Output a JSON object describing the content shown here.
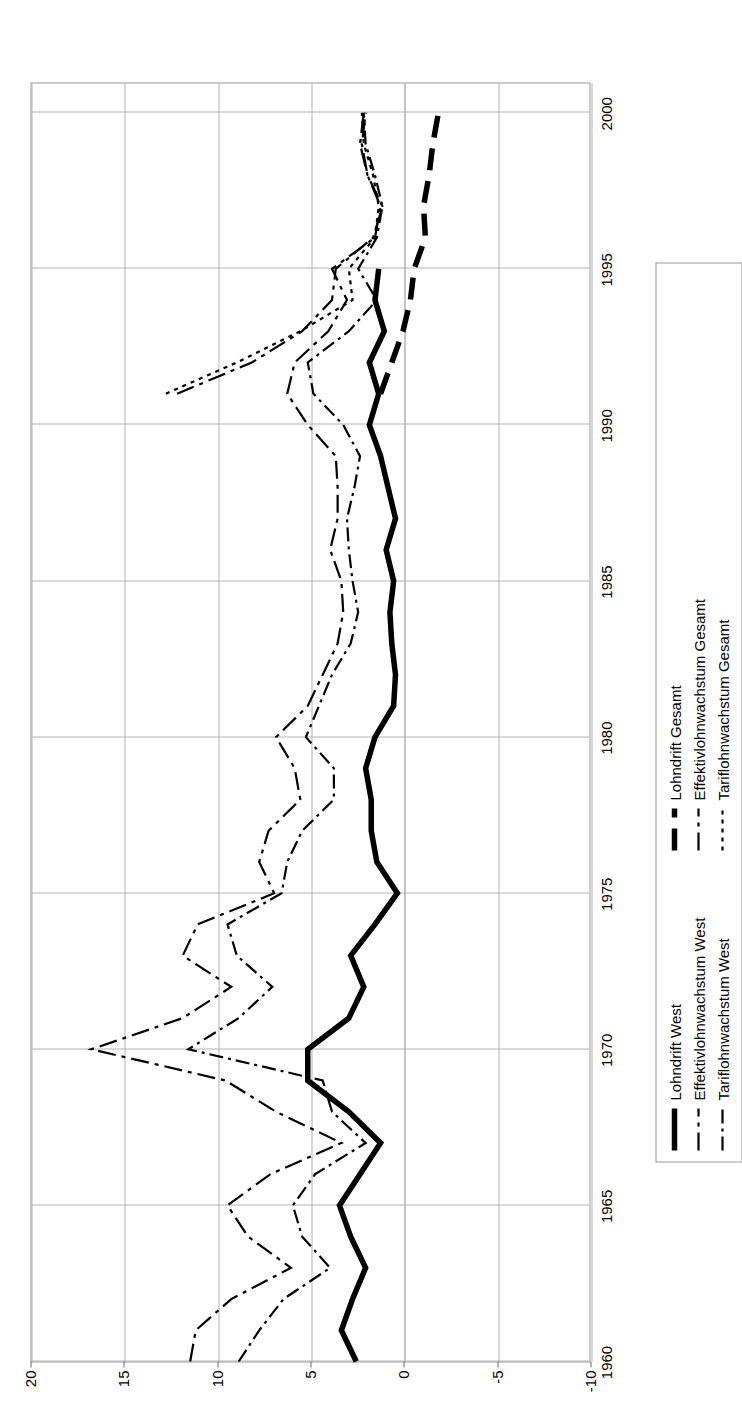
{
  "chart_data": {
    "type": "line",
    "title": "",
    "xlabel": "",
    "ylabel": "",
    "orientation": "rotated-90-ccw",
    "grid": true,
    "legend_position": "bottom",
    "ylim": [
      -10,
      20
    ],
    "yticks": [
      "20",
      "15",
      "10",
      "5",
      "0",
      "-5",
      "-10"
    ],
    "ytick_values": [
      20,
      15,
      10,
      5,
      0,
      -5,
      -10
    ],
    "xlim": [
      1960,
      2001
    ],
    "xticks": [
      "1960",
      "1965",
      "1970",
      "1975",
      "1980",
      "1985",
      "1990",
      "1995",
      "2000"
    ],
    "xtick_values": [
      1960,
      1965,
      1970,
      1975,
      1980,
      1985,
      1990,
      1995,
      2000
    ],
    "x": [
      1960,
      1961,
      1962,
      1963,
      1964,
      1965,
      1966,
      1967,
      1968,
      1969,
      1970,
      1971,
      1972,
      1973,
      1974,
      1975,
      1976,
      1977,
      1978,
      1979,
      1980,
      1981,
      1982,
      1983,
      1984,
      1985,
      1986,
      1987,
      1988,
      1989,
      1990,
      1991,
      1992,
      1993,
      1994,
      1995,
      1996,
      1997,
      1998,
      1999,
      2000
    ],
    "series": [
      {
        "name": "Lohndrift West",
        "style": "solid",
        "width": "thick",
        "color": "#000000",
        "values": [
          2.6,
          3.4,
          2.8,
          2.1,
          2.9,
          3.5,
          2.4,
          1.3,
          3.0,
          5.2,
          5.2,
          3.0,
          2.2,
          2.9,
          1.6,
          0.4,
          1.5,
          1.8,
          1.8,
          2.1,
          1.6,
          0.6,
          0.5,
          0.7,
          0.8,
          0.6,
          1.0,
          0.5,
          0.9,
          1.3,
          1.9,
          1.4,
          1.9,
          1.1,
          1.6,
          1.4,
          null,
          null,
          null,
          null,
          null
        ]
      },
      {
        "name": "Lohndrift Gesamt",
        "style": "dashed",
        "width": "thick",
        "color": "#000000",
        "values": [
          null,
          null,
          null,
          null,
          null,
          null,
          null,
          null,
          null,
          null,
          null,
          null,
          null,
          null,
          null,
          null,
          null,
          null,
          null,
          null,
          null,
          null,
          null,
          null,
          null,
          null,
          null,
          null,
          null,
          null,
          null,
          1.3,
          0.7,
          0.1,
          -0.3,
          -0.5,
          -1.1,
          -1.0,
          -1.3,
          -1.5,
          -1.8
        ]
      },
      {
        "name": "Effektivlohnwachstum West",
        "style": "dashdot",
        "width": "thin",
        "color": "#000000",
        "values": [
          11.5,
          11.2,
          9.3,
          6.1,
          8.4,
          9.5,
          7.2,
          3.4,
          6.9,
          9.6,
          16.8,
          11.9,
          9.3,
          11.9,
          11.1,
          7.0,
          7.8,
          7.3,
          5.6,
          5.9,
          6.9,
          5.2,
          4.4,
          3.6,
          3.3,
          3.4,
          4.0,
          3.6,
          3.6,
          3.7,
          5.2,
          6.3,
          5.9,
          4.1,
          3.1,
          3.9,
          1.6,
          1.3,
          2.0,
          2.3,
          2.1
        ]
      },
      {
        "name": "Effektivlohnwachstum Gesamt",
        "style": "dashdot",
        "width": "thin",
        "color": "#000000",
        "values": [
          null,
          null,
          null,
          null,
          null,
          null,
          null,
          null,
          null,
          null,
          null,
          null,
          null,
          null,
          null,
          null,
          null,
          null,
          null,
          null,
          null,
          null,
          null,
          null,
          null,
          null,
          null,
          null,
          null,
          null,
          null,
          12.2,
          8.2,
          5.5,
          3.9,
          3.7,
          1.7,
          1.2,
          2.0,
          2.4,
          2.2
        ]
      },
      {
        "name": "Tariflohnwachstum West",
        "style": "dashdot-thin",
        "width": "thin",
        "color": "#000000",
        "values": [
          8.9,
          7.8,
          6.5,
          4.0,
          5.5,
          6.0,
          4.8,
          2.1,
          3.9,
          4.4,
          11.6,
          8.9,
          7.1,
          9.0,
          9.5,
          6.6,
          6.3,
          5.5,
          3.8,
          3.8,
          5.3,
          4.6,
          3.9,
          2.9,
          2.5,
          2.8,
          3.0,
          3.1,
          2.7,
          2.4,
          3.3,
          4.9,
          5.2,
          3.0,
          1.5,
          2.5,
          1.5,
          1.2,
          1.6,
          2.1,
          2.2
        ]
      },
      {
        "name": "Tariflohnwachstum Gesamt",
        "style": "dotted",
        "width": "thin",
        "color": "#000000",
        "values": [
          null,
          null,
          null,
          null,
          null,
          null,
          null,
          null,
          null,
          null,
          null,
          null,
          null,
          null,
          null,
          null,
          null,
          null,
          null,
          null,
          null,
          null,
          null,
          null,
          null,
          null,
          null,
          null,
          null,
          null,
          null,
          12.8,
          9.0,
          5.6,
          2.8,
          3.0,
          1.6,
          1.4,
          1.7,
          2.2,
          2.3
        ]
      }
    ]
  },
  "axes": {
    "value_axis": {
      "name": "value-axis",
      "labels": [
        "20",
        "15",
        "10",
        "5",
        "0",
        "-5",
        "-10"
      ]
    },
    "category_axis": {
      "name": "year-axis",
      "labels": [
        "1960",
        "1965",
        "1970",
        "1975",
        "1980",
        "1985",
        "1990",
        "1995",
        "2000"
      ]
    }
  },
  "legend": {
    "items": [
      {
        "label": "Lohndrift West",
        "key": "solid-thick-line-key"
      },
      {
        "label": "Lohndrift Gesamt",
        "key": "dashed-thick-line-key"
      },
      {
        "label": "Effektivlohnwachstum West",
        "key": "solid-thin-line-key"
      },
      {
        "label": "Effektivlohnwachstum Gesamt",
        "key": "dashdot-line-key"
      },
      {
        "label": "Tariflohnwachstum West",
        "key": "dashdot-thin-line-key"
      },
      {
        "label": "Tariflohnwachstum Gesamt",
        "key": "dotted-line-key"
      }
    ]
  }
}
